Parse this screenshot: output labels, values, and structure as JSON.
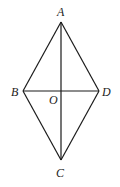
{
  "figure": {
    "type": "rhombus-with-diagonals",
    "points": {
      "A": {
        "label": "A",
        "x": 61,
        "y": 22,
        "lx": 57,
        "ly": 16
      },
      "B": {
        "label": "B",
        "x": 23,
        "y": 91,
        "lx": 11,
        "ly": 96
      },
      "C": {
        "label": "C",
        "x": 61,
        "y": 160,
        "lx": 56,
        "ly": 177
      },
      "D": {
        "label": "D",
        "x": 99,
        "y": 91,
        "lx": 102,
        "ly": 96
      },
      "O": {
        "label": "O",
        "x": 61,
        "y": 91,
        "lx": 49,
        "ly": 104
      }
    },
    "segments": [
      [
        "A",
        "B"
      ],
      [
        "B",
        "C"
      ],
      [
        "C",
        "D"
      ],
      [
        "D",
        "A"
      ],
      [
        "A",
        "C"
      ],
      [
        "B",
        "D"
      ]
    ],
    "line_color": "#1a1a1a"
  }
}
